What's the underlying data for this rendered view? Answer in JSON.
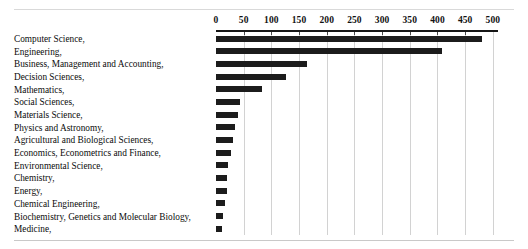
{
  "chart_data": {
    "type": "bar",
    "orientation": "horizontal",
    "title": "",
    "subtitle": "",
    "xlabel": "",
    "ylabel": "",
    "xlim": [
      0,
      500
    ],
    "grid": true,
    "axis_position": "top",
    "legend": "none",
    "tick_labels": [
      "0",
      "50",
      "100",
      "150",
      "200",
      "250",
      "300",
      "350",
      "400",
      "450",
      "500"
    ],
    "ticks": [
      0,
      50,
      100,
      150,
      200,
      250,
      300,
      350,
      400,
      450,
      500
    ],
    "categories": [
      "Computer Science,",
      "Engineering,",
      "Business, Management and Accounting,",
      "Decision Sciences,",
      "Mathematics,",
      "Social Sciences,",
      "Materials Science,",
      "Physics and Astronomy,",
      "Agricultural and Biological Sciences,",
      "Economics, Econometrics and Finance,",
      "Environmental Science,",
      "Chemistry,",
      "Energy,",
      "Chemical Engineering,",
      "Biochemistry, Genetics and Molecular Biology,",
      "Medicine,"
    ],
    "values": [
      480,
      408,
      164,
      126,
      83,
      44,
      39,
      35,
      30,
      27,
      22,
      20,
      19,
      16,
      12,
      10
    ],
    "bar_color": "#1c1c1c",
    "grid_color": "#d2d2d2",
    "axis_color": "#161616"
  }
}
